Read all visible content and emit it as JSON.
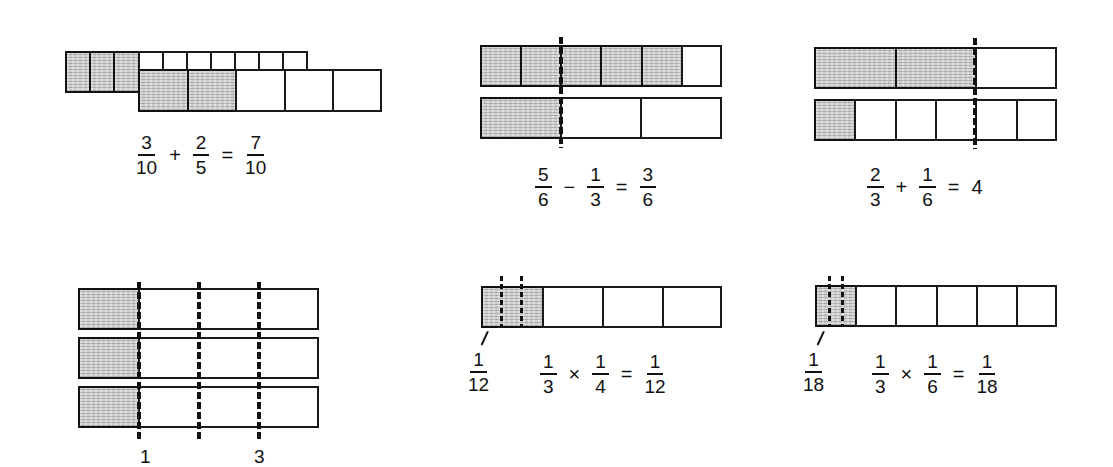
{
  "figure": {
    "shading_color": "#cfcfcf",
    "line_color": "#111111"
  },
  "panels": {
    "add_tenths_fifths": {
      "top_bar": {
        "parts": 10,
        "shaded": 3
      },
      "bottom_bar": {
        "parts": 5,
        "shaded": 2
      },
      "equation": {
        "a": {
          "num": "3",
          "den": "10"
        },
        "op": "+",
        "b": {
          "num": "2",
          "den": "5"
        },
        "eq": "=",
        "result": {
          "num": "7",
          "den": "10"
        }
      }
    },
    "subtract_sixths_thirds": {
      "top_bar": {
        "parts": 6,
        "shaded": 5
      },
      "bottom_bar": {
        "parts": 3,
        "shaded": 1
      },
      "equation": {
        "a": {
          "num": "5",
          "den": "6"
        },
        "op": "−",
        "b": {
          "num": "1",
          "den": "3"
        },
        "eq": "=",
        "result": {
          "num": "3",
          "den": "6"
        }
      }
    },
    "add_thirds_sixths": {
      "top_bar": {
        "parts": 3,
        "shaded": 2
      },
      "bottom_bar": {
        "parts": 6,
        "shaded": 1
      },
      "equation": {
        "a": {
          "num": "2",
          "den": "3"
        },
        "op": "+",
        "b": {
          "num": "1",
          "den": "6"
        },
        "eq": "=",
        "result_whole": "4"
      }
    },
    "three_bars_quarters": {
      "bars": 3,
      "shaded_fraction": "1/4",
      "dashed_marks": 3,
      "bottom_labels": [
        "1",
        "3"
      ]
    },
    "multiply_third_quarter": {
      "bar": {
        "parts": 4,
        "shaded": 1,
        "shaded_subdivisions": 3
      },
      "pointer_label": {
        "num": "1",
        "den": "12"
      },
      "equation": {
        "a": {
          "num": "1",
          "den": "3"
        },
        "op": "×",
        "b": {
          "num": "1",
          "den": "4"
        },
        "eq": "=",
        "result": {
          "num": "1",
          "den": "12"
        }
      }
    },
    "multiply_third_sixth": {
      "bar": {
        "parts": 6,
        "shaded": 1,
        "shaded_subdivisions": 3
      },
      "pointer_label": {
        "num": "1",
        "den": "18"
      },
      "equation": {
        "a": {
          "num": "1",
          "den": "3"
        },
        "op": "×",
        "b": {
          "num": "1",
          "den": "6"
        },
        "eq": "=",
        "result": {
          "num": "1",
          "den": "18"
        }
      }
    }
  }
}
